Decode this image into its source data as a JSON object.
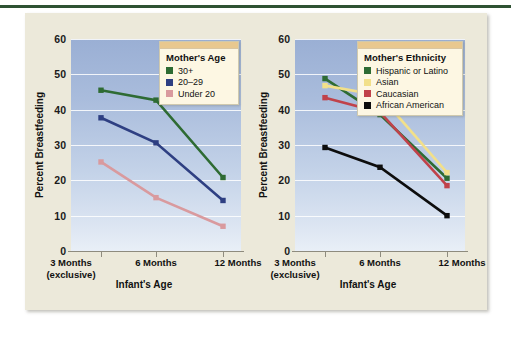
{
  "figure": {
    "background": "#ffffff",
    "card_background": "#ece9da",
    "top_rule_color": "#2f5233"
  },
  "chart_data": [
    {
      "type": "line",
      "title": "",
      "panel": "left",
      "xlabel": "Infant's Age",
      "ylabel": "Percent Breastfeeding",
      "categories": [
        "3 Months\n(exclusive)",
        "6 Months",
        "12 Months"
      ],
      "category_lines": [
        [
          "3 Months",
          "(exclusive)"
        ],
        [
          "6 Months",
          ""
        ],
        [
          "12 Months",
          ""
        ]
      ],
      "ylim": [
        0,
        60
      ],
      "yticks": [
        0,
        10,
        20,
        30,
        40,
        50,
        60
      ],
      "grid": true,
      "legend_position": "top-right",
      "legend_title": "Mother's Age",
      "series": [
        {
          "name": "30+",
          "color": "#2e6b33",
          "values": [
            45.5,
            42.7,
            20.8
          ]
        },
        {
          "name": "20–29",
          "color": "#2e3f82",
          "values": [
            37.7,
            30.6,
            14.3
          ]
        },
        {
          "name": "Under 20",
          "color": "#d99a9e",
          "values": [
            25.2,
            15.1,
            7.0
          ]
        }
      ]
    },
    {
      "type": "line",
      "title": "",
      "panel": "right",
      "xlabel": "Infant's Age",
      "ylabel": "Percent Breastfeeding",
      "categories": [
        "3 Months\n(exclusive)",
        "6 Months",
        "12 Months"
      ],
      "category_lines": [
        [
          "3 Months",
          "(exclusive)"
        ],
        [
          "6 Months",
          ""
        ],
        [
          "12 Months",
          ""
        ]
      ],
      "ylim": [
        0,
        60
      ],
      "yticks": [
        0,
        10,
        20,
        30,
        40,
        50,
        60
      ],
      "grid": true,
      "legend_position": "top-right",
      "legend_title": "Mother's Ethnicity",
      "series": [
        {
          "name": "Hispanic or Latino",
          "color": "#2e6b33",
          "values": [
            48.8,
            38.6,
            20.6
          ]
        },
        {
          "name": "Asian",
          "color": "#f2e08a",
          "values": [
            46.8,
            44.0,
            22.2
          ]
        },
        {
          "name": "Caucasian",
          "color": "#c0424a",
          "values": [
            43.4,
            39.3,
            18.5
          ]
        },
        {
          "name": "African American",
          "color": "#0d0d0d",
          "values": [
            29.3,
            23.7,
            10.0
          ]
        }
      ]
    }
  ],
  "left_panel": {
    "ytitle": "Percent Breastfeeding",
    "xtitle": "Infant's Age",
    "ytick_labels": [
      "0",
      "10",
      "20",
      "30",
      "40",
      "50",
      "60"
    ],
    "xcat_1_main": "3 Months",
    "xcat_1_sub": "(exclusive)",
    "xcat_2_main": "6 Months",
    "xcat_3_main": "12 Months",
    "legend": {
      "title": "Mother's Age",
      "items": [
        {
          "label": "30+",
          "color": "#2e6b33"
        },
        {
          "label": "20–29",
          "color": "#2e3f82"
        },
        {
          "label": "Under 20",
          "color": "#d99a9e"
        }
      ]
    }
  },
  "right_panel": {
    "ytitle": "Percent Breastfeeding",
    "xtitle": "Infant's Age",
    "ytick_labels": [
      "0",
      "10",
      "20",
      "30",
      "40",
      "50",
      "60"
    ],
    "xcat_1_main": "3 Months",
    "xcat_1_sub": "(exclusive)",
    "xcat_2_main": "6 Months",
    "xcat_3_main": "12 Months",
    "legend": {
      "title": "Mother's Ethnicity",
      "items": [
        {
          "label": "Hispanic or Latino",
          "color": "#2e6b33"
        },
        {
          "label": "Asian",
          "color": "#f2e08a"
        },
        {
          "label": "Caucasian",
          "color": "#c0424a"
        },
        {
          "label": "African American",
          "color": "#0d0d0d"
        }
      ]
    }
  }
}
